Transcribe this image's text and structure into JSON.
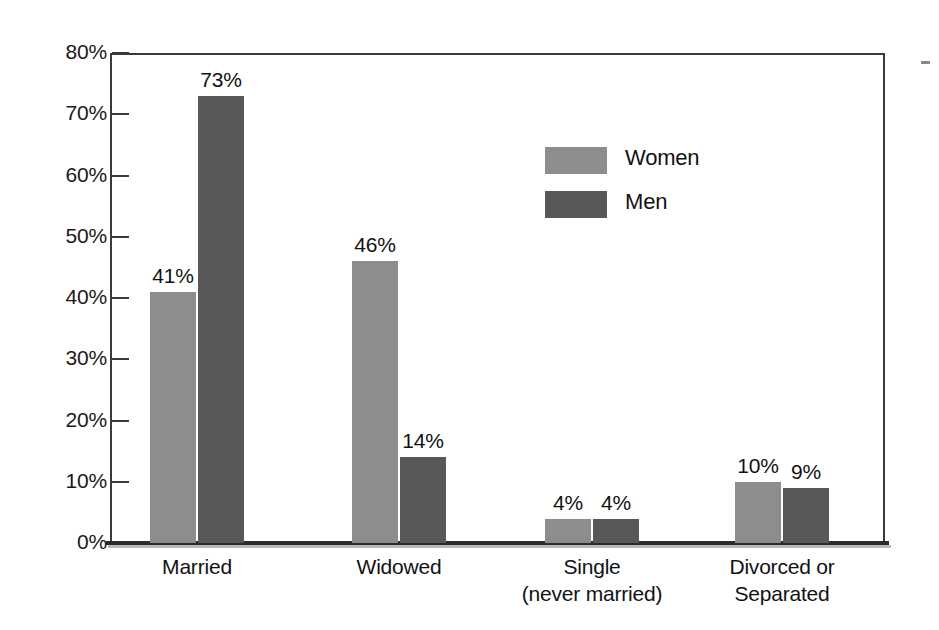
{
  "chart_data": {
    "type": "bar",
    "title": "",
    "xlabel": "",
    "ylabel": "",
    "ylim": [
      0,
      80
    ],
    "ytick_labels": [
      "80%",
      "70%",
      "60%",
      "50%",
      "40%",
      "30%",
      "20%",
      "10%",
      "0%"
    ],
    "ytick_values": [
      80,
      70,
      60,
      50,
      40,
      30,
      20,
      10,
      0
    ],
    "grid": false,
    "legend_position": "inside-upper-center",
    "categories": [
      "Married",
      "Widowed",
      "Single (never married)",
      "Divorced or Separated"
    ],
    "category_label_lines": [
      [
        "Married"
      ],
      [
        "Widowed"
      ],
      [
        "Single",
        "(never married)"
      ],
      [
        "Divorced or",
        "Separated"
      ]
    ],
    "series": [
      {
        "name": "Women",
        "color": "#8d8d8d",
        "values": [
          41,
          46,
          4,
          10
        ],
        "value_labels": [
          "41%",
          "46%",
          "4%",
          "10%"
        ]
      },
      {
        "name": "Men",
        "color": "#585858",
        "values": [
          73,
          14,
          4,
          9
        ],
        "value_labels": [
          "73%",
          "14%",
          "4%",
          "9%"
        ]
      }
    ]
  },
  "legend": {
    "items": [
      {
        "label": "Women",
        "color": "#8d8d8d"
      },
      {
        "label": "Men",
        "color": "#585858"
      }
    ]
  },
  "colors": {
    "women": "#8d8d8d",
    "men": "#585858",
    "axis": "#3a3a3a",
    "text": "#121212",
    "background": "#ffffff"
  }
}
